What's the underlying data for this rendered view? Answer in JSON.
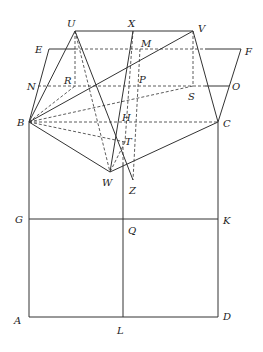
{
  "diagram": {
    "type": "geometric construction",
    "points": {
      "U": [
        75,
        31
      ],
      "X": [
        133,
        31
      ],
      "V": [
        193,
        31
      ],
      "E": [
        49,
        49
      ],
      "M": [
        140,
        49
      ],
      "F": [
        241,
        49
      ],
      "N": [
        38,
        86
      ],
      "R": [
        75,
        86
      ],
      "P": [
        136,
        86
      ],
      "S": [
        193,
        86
      ],
      "O": [
        229,
        86
      ],
      "B": [
        29,
        122
      ],
      "H": [
        121,
        122
      ],
      "C": [
        218,
        122
      ],
      "T": [
        125,
        142
      ],
      "W": [
        110,
        172
      ],
      "Z": [
        133,
        180
      ],
      "G": [
        29,
        219
      ],
      "Q": [
        123,
        219
      ],
      "K": [
        218,
        219
      ],
      "A": [
        29,
        317
      ],
      "L": [
        123,
        317
      ],
      "D": [
        218,
        317
      ]
    },
    "labels": [
      {
        "id": "U",
        "text": "U",
        "x": 67,
        "y": 27
      },
      {
        "id": "X",
        "text": "X",
        "x": 128,
        "y": 27
      },
      {
        "id": "V",
        "text": "V",
        "x": 198,
        "y": 32
      },
      {
        "id": "E",
        "text": "E",
        "x": 35,
        "y": 53
      },
      {
        "id": "M",
        "text": "M",
        "x": 141,
        "y": 47
      },
      {
        "id": "F",
        "text": "F",
        "x": 245,
        "y": 55
      },
      {
        "id": "N",
        "text": "N",
        "x": 27,
        "y": 90
      },
      {
        "id": "R",
        "text": "R",
        "x": 64,
        "y": 84
      },
      {
        "id": "P",
        "text": "P",
        "x": 139,
        "y": 83
      },
      {
        "id": "S",
        "text": "S",
        "x": 188,
        "y": 100
      },
      {
        "id": "O",
        "text": "O",
        "x": 232,
        "y": 90
      },
      {
        "id": "B",
        "text": "B",
        "x": 17,
        "y": 126
      },
      {
        "id": "H",
        "text": "H",
        "x": 122,
        "y": 121
      },
      {
        "id": "C",
        "text": "C",
        "x": 223,
        "y": 127
      },
      {
        "id": "T",
        "text": "T",
        "x": 125,
        "y": 145
      },
      {
        "id": "W",
        "text": "W",
        "x": 102,
        "y": 186
      },
      {
        "id": "Z",
        "text": "Z",
        "x": 129,
        "y": 194
      },
      {
        "id": "G",
        "text": "G",
        "x": 15,
        "y": 223
      },
      {
        "id": "Q",
        "text": "Q",
        "x": 128,
        "y": 234
      },
      {
        "id": "K",
        "text": "K",
        "x": 223,
        "y": 224
      },
      {
        "id": "A",
        "text": "A",
        "x": 14,
        "y": 324
      },
      {
        "id": "L",
        "text": "L",
        "x": 117,
        "y": 334
      },
      {
        "id": "D",
        "text": "D",
        "x": 223,
        "y": 320
      }
    ],
    "solid_segments": [
      [
        "U",
        "V"
      ],
      [
        "E",
        "F"
      ],
      [
        "N",
        "O"
      ],
      [
        "B",
        "E"
      ],
      [
        "B",
        "U"
      ],
      [
        "B",
        "V"
      ],
      [
        "V",
        "C"
      ],
      [
        "F",
        "C"
      ],
      [
        "B",
        "W"
      ],
      [
        "W",
        "C"
      ],
      [
        "X",
        "W"
      ],
      [
        "U",
        "Z"
      ],
      [
        "B",
        "A"
      ],
      [
        "C",
        "D"
      ],
      [
        "A",
        "D"
      ],
      [
        "G",
        "K"
      ],
      [
        "Q",
        "L"
      ]
    ],
    "dashed_segments": [
      [
        "U",
        "R"
      ],
      [
        "V",
        "S"
      ],
      [
        "B",
        "C"
      ],
      [
        "B",
        "R"
      ],
      [
        "B",
        "S"
      ],
      [
        "M",
        "Z"
      ],
      [
        "X",
        "T"
      ],
      [
        "B",
        "T"
      ],
      [
        "T",
        "W"
      ],
      [
        "N",
        "R"
      ],
      [
        "S",
        "O"
      ]
    ]
  }
}
